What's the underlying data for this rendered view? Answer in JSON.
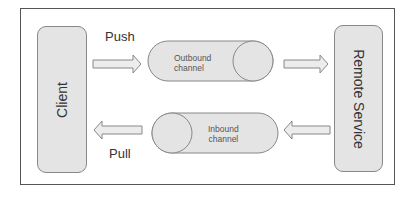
{
  "diagram": {
    "client": {
      "label": "Client"
    },
    "remote": {
      "label": "Remote Service"
    },
    "push": {
      "label": "Push"
    },
    "pull": {
      "label": "Pull"
    },
    "outbound": {
      "line1": "Outbound",
      "line2": "channel"
    },
    "inbound": {
      "line1": "Inbound",
      "line2": "channel"
    },
    "colors": {
      "fill": "#e4e4e4",
      "stroke": "#888888",
      "frame": "#555555"
    }
  }
}
